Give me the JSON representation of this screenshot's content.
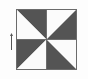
{
  "canvas": {
    "width": 88,
    "height": 79,
    "background_color": "#fdfdfd"
  },
  "figure": {
    "name": "pinwheel-block",
    "bounds": {
      "x": 16,
      "y": 9,
      "width": 61,
      "height": 61
    },
    "border_color": "#6b6b6b",
    "border_width": 1,
    "dark_color": "#545454",
    "light_color": "#fbfbfb",
    "center": {
      "x": 30.5,
      "y": 30.5
    },
    "segments": [
      {
        "label": "top-left-upper-right-triangle",
        "fill": "dark",
        "points": "0,0 30.5,0 30.5,30.5"
      },
      {
        "label": "top-left-lower-left-triangle",
        "fill": "light",
        "points": "0,0 30.5,30.5 0,30.5"
      },
      {
        "label": "top-right-upper-left-triangle",
        "fill": "light",
        "points": "30.5,0 61,0 30.5,30.5"
      },
      {
        "label": "top-right-lower-right-triangle",
        "fill": "dark",
        "points": "61,0 61,30.5 30.5,30.5"
      },
      {
        "label": "bottom-left-upper-left-triangle",
        "fill": "dark",
        "points": "0,30.5 30.5,30.5 0,61"
      },
      {
        "label": "bottom-left-lower-right-triangle",
        "fill": "light",
        "points": "30.5,30.5 30.5,61 0,61"
      },
      {
        "label": "bottom-right-upper-right-triangle",
        "fill": "light",
        "points": "30.5,30.5 61,30.5 61,61"
      },
      {
        "label": "bottom-right-lower-left-triangle",
        "fill": "dark",
        "points": "30.5,30.5 61,61 30.5,61"
      }
    ],
    "divider_color": "#6b6b6b",
    "dividers": [
      {
        "label": "vertical-midline",
        "x1": 30.5,
        "y1": 0,
        "x2": 30.5,
        "y2": 61
      },
      {
        "label": "horizontal-midline",
        "x1": 0,
        "y1": 30.5,
        "x2": 61,
        "y2": 30.5
      }
    ]
  },
  "marker": {
    "name": "left-edge-tick-marker",
    "color": "#555555",
    "bounds": {
      "x": 10,
      "y": 33,
      "width": 3,
      "height": 17
    },
    "shape": "thin vertical line with small arrowhead at top"
  }
}
